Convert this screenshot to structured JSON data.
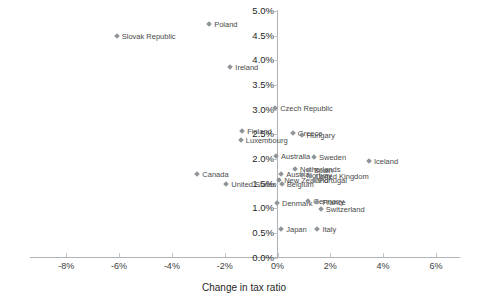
{
  "chart_data": {
    "type": "scatter",
    "title": "",
    "xlabel": "Change in tax ratio",
    "ylabel": "",
    "xlim": [
      -8,
      6
    ],
    "ylim": [
      0.0,
      5.0
    ],
    "xticks": [
      "-8%",
      "-6%",
      "-4%",
      "-2%",
      "0%",
      "2%",
      "4%",
      "6%"
    ],
    "xtick_values": [
      -8,
      -6,
      -4,
      -2,
      0,
      2,
      4,
      6
    ],
    "yticks": [
      "0.0%",
      "0.5%",
      "1.0%",
      "1.5%",
      "2.0%",
      "2.5%",
      "3.0%",
      "3.5%",
      "4.0%",
      "4.5%",
      "5.0%"
    ],
    "ytick_values": [
      0.0,
      0.5,
      1.0,
      1.5,
      2.0,
      2.5,
      3.0,
      3.5,
      4.0,
      4.5,
      5.0
    ],
    "grid": false,
    "legend": "none",
    "marker_color": "#8f9499",
    "points": [
      {
        "label": "Poland",
        "x": -2.55,
        "y": 4.72
      },
      {
        "label": "Slovak Republic",
        "x": -6.05,
        "y": 4.47
      },
      {
        "label": "Ireland",
        "x": -1.75,
        "y": 3.85
      },
      {
        "label": "Czech Republic",
        "x": -0.05,
        "y": 3.02
      },
      {
        "label": "Finland",
        "x": -1.3,
        "y": 2.54
      },
      {
        "label": "Greece",
        "x": 0.62,
        "y": 2.5
      },
      {
        "label": "Hungary",
        "x": 0.95,
        "y": 2.46
      },
      {
        "label": "Luxembourg",
        "x": -1.35,
        "y": 2.36
      },
      {
        "label": "Australia",
        "x": -0.02,
        "y": 2.03
      },
      {
        "label": "Sweden",
        "x": 1.42,
        "y": 2.01
      },
      {
        "label": "Netherlands",
        "x": 0.7,
        "y": 1.78
      },
      {
        "label": "Spain",
        "x": 1.22,
        "y": 1.76
      },
      {
        "label": "Austria",
        "x": 0.18,
        "y": 1.67
      },
      {
        "label": "Norway",
        "x": 0.95,
        "y": 1.66
      },
      {
        "label": "United Kingdom",
        "x": 1.28,
        "y": 1.64
      },
      {
        "label": "New Zealand",
        "x": 0.1,
        "y": 1.56
      },
      {
        "label": "Portugal",
        "x": 1.42,
        "y": 1.55
      },
      {
        "label": "United States",
        "x": -1.9,
        "y": 1.48
      },
      {
        "label": "Belgium",
        "x": 0.2,
        "y": 1.47
      },
      {
        "label": "Canada",
        "x": -3.0,
        "y": 1.68
      },
      {
        "label": "Denmark",
        "x": 0.02,
        "y": 1.08
      },
      {
        "label": "Germany",
        "x": 1.2,
        "y": 1.12
      },
      {
        "label": "France",
        "x": 1.55,
        "y": 1.11
      },
      {
        "label": "Switzerland",
        "x": 1.68,
        "y": 0.97
      },
      {
        "label": "Japan",
        "x": 0.18,
        "y": 0.55
      },
      {
        "label": "Italy",
        "x": 1.55,
        "y": 0.55
      },
      {
        "label": "Iceland",
        "x": 3.5,
        "y": 1.93
      }
    ]
  }
}
